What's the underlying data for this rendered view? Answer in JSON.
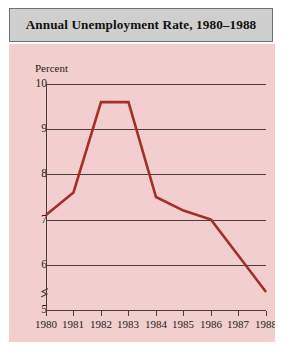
{
  "title": "Annual Unemployment Rate, 1980–1988",
  "axis_unit_label": "Percent",
  "colors": {
    "title_bar_background": "#cfcfcf",
    "title_bar_border": "#6f6f6f",
    "panel_background": "#f2cfce",
    "line": "#a33028",
    "axis": "#4d3d3a",
    "text": "#241c1a"
  },
  "axis_break_symbol": "axis-break",
  "chart_data": {
    "type": "line",
    "title": "Annual Unemployment Rate, 1980–1988",
    "xlabel": "",
    "ylabel": "Percent",
    "x": [
      1980,
      1981,
      1982,
      1983,
      1984,
      1985,
      1986,
      1987,
      1988
    ],
    "categories": [
      "1980",
      "1981",
      "1982",
      "1983",
      "1984",
      "1985",
      "1986",
      "1987",
      "1988"
    ],
    "values": [
      7.1,
      7.6,
      9.6,
      9.6,
      7.5,
      7.2,
      7.0,
      6.2,
      5.4
    ],
    "series": [
      {
        "name": "Annual Unemployment Rate",
        "values": [
          7.1,
          7.6,
          9.6,
          9.6,
          7.5,
          7.2,
          7.0,
          6.2,
          5.4
        ]
      }
    ],
    "ylim": [
      4.6,
      10.2
    ],
    "yticks": [
      5,
      6,
      7,
      8,
      9,
      10
    ],
    "ytick_labels": [
      "5",
      "6",
      "7",
      "8",
      "9",
      "10"
    ],
    "xtick_labels": [
      "1980",
      "1981",
      "1982",
      "1983",
      "1984",
      "1985",
      "1986",
      "1987",
      "1988"
    ],
    "grid": true,
    "grid_axis": "y",
    "legend": false,
    "legend_position": "none",
    "axis_break": "y-axis broken below 5",
    "line_color": "#a33028",
    "annotations": []
  }
}
